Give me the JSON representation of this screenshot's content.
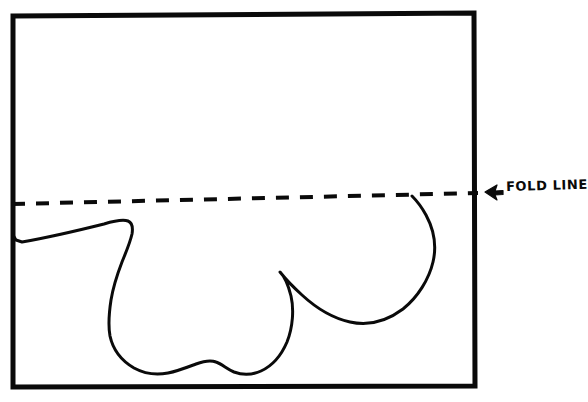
{
  "figure": {
    "background_color": "#ffffff",
    "ink_color": "#0a0a0a",
    "width": 588,
    "height": 402
  },
  "frame": {
    "name": "paper-border",
    "stroke_width": 5,
    "left": 13,
    "top": 14,
    "right": 474,
    "bottom": 386
  },
  "fold_line": {
    "label": "FOLD LINE",
    "style": "dashed",
    "stroke_width": 4,
    "dash_pattern": "13 11",
    "start_x": 12,
    "start_y": 204,
    "end_x": 478,
    "end_y": 193
  },
  "arrow": {
    "name": "left-arrow",
    "glyph": "←",
    "x": 486,
    "y": 192,
    "direction": "left"
  },
  "outline": {
    "name": "half-heart-template",
    "stroke_width": 3,
    "description": "Curved cut-line forming half of a heart shape against the fold line",
    "key_points": [
      {
        "label": "left-edge-start",
        "x": 13,
        "y": 237
      },
      {
        "label": "left-lobe-peak",
        "x": 128,
        "y": 221
      },
      {
        "label": "left-lobe-outer-bottom",
        "x": 110,
        "y": 330
      },
      {
        "label": "bottom-left-dip",
        "x": 175,
        "y": 372
      },
      {
        "label": "center-bump",
        "x": 213,
        "y": 362
      },
      {
        "label": "bottom-right-dip",
        "x": 250,
        "y": 371
      },
      {
        "label": "inner-cusp",
        "x": 280,
        "y": 272
      },
      {
        "label": "right-lobe-bottom",
        "x": 355,
        "y": 320
      },
      {
        "label": "right-lobe-outer",
        "x": 434,
        "y": 272
      },
      {
        "label": "fold-line-contact",
        "x": 412,
        "y": 196
      }
    ]
  }
}
